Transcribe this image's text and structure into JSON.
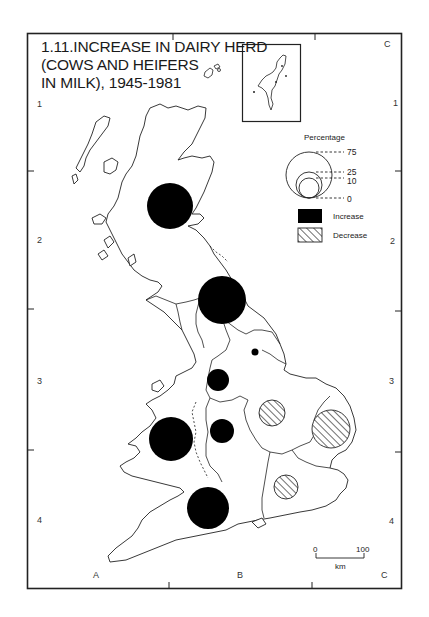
{
  "map": {
    "title_lines": [
      "1.11.INCREASE IN DAIRY HERD",
      "(COWS AND HEIFERS",
      "IN MILK), 1945-1981"
    ],
    "grid": {
      "columns": [
        "A",
        "B",
        "C"
      ],
      "rows": [
        "1",
        "2",
        "3",
        "4"
      ]
    },
    "legend": {
      "title": "Percentage",
      "size_values": [
        "75",
        "25",
        "10",
        "0"
      ],
      "keys": [
        {
          "label": "Increase",
          "fill": "#000000",
          "pattern": "solid"
        },
        {
          "label": "Decrease",
          "fill": "#ffffff",
          "pattern": "hatched"
        }
      ]
    },
    "scale_bar": {
      "start": "0",
      "end": "100",
      "unit": "km"
    },
    "inset": {
      "name": "Shetland Islands inset"
    },
    "regions": [
      {
        "name": "Scotland",
        "type": "increase",
        "cx": 170,
        "cy": 206,
        "r": 23
      },
      {
        "name": "Northern England (Cumbria/Lancashire)",
        "type": "increase",
        "cx": 222,
        "cy": 300,
        "r": 24
      },
      {
        "name": "Yorkshire & Humberside",
        "type": "increase",
        "cx": 255,
        "cy": 352,
        "r": 3.5
      },
      {
        "name": "North West (Cheshire)",
        "type": "increase",
        "cx": 218,
        "cy": 380,
        "r": 11
      },
      {
        "name": "Wales",
        "type": "increase",
        "cx": 171,
        "cy": 439,
        "r": 22
      },
      {
        "name": "West Midlands",
        "type": "increase",
        "cx": 222,
        "cy": 431,
        "r": 12
      },
      {
        "name": "South West",
        "type": "increase",
        "cx": 208,
        "cy": 508,
        "r": 21
      },
      {
        "name": "East Midlands",
        "type": "decrease",
        "cx": 272,
        "cy": 413,
        "r": 13
      },
      {
        "name": "East Anglia",
        "type": "decrease",
        "cx": 331,
        "cy": 429,
        "r": 19
      },
      {
        "name": "South East",
        "type": "decrease",
        "cx": 286,
        "cy": 487,
        "r": 12
      }
    ]
  }
}
